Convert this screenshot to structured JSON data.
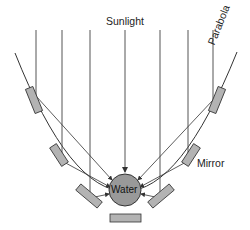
{
  "diagram": {
    "labels": {
      "sunlight": "Sunlight",
      "parabola": "Parabola",
      "mirror": "Mirror",
      "water": "Water"
    },
    "colors": {
      "line": "#333333",
      "mirror_fill": "#b3b3b3",
      "water_fill": "#999999",
      "background": "#ffffff"
    }
  }
}
